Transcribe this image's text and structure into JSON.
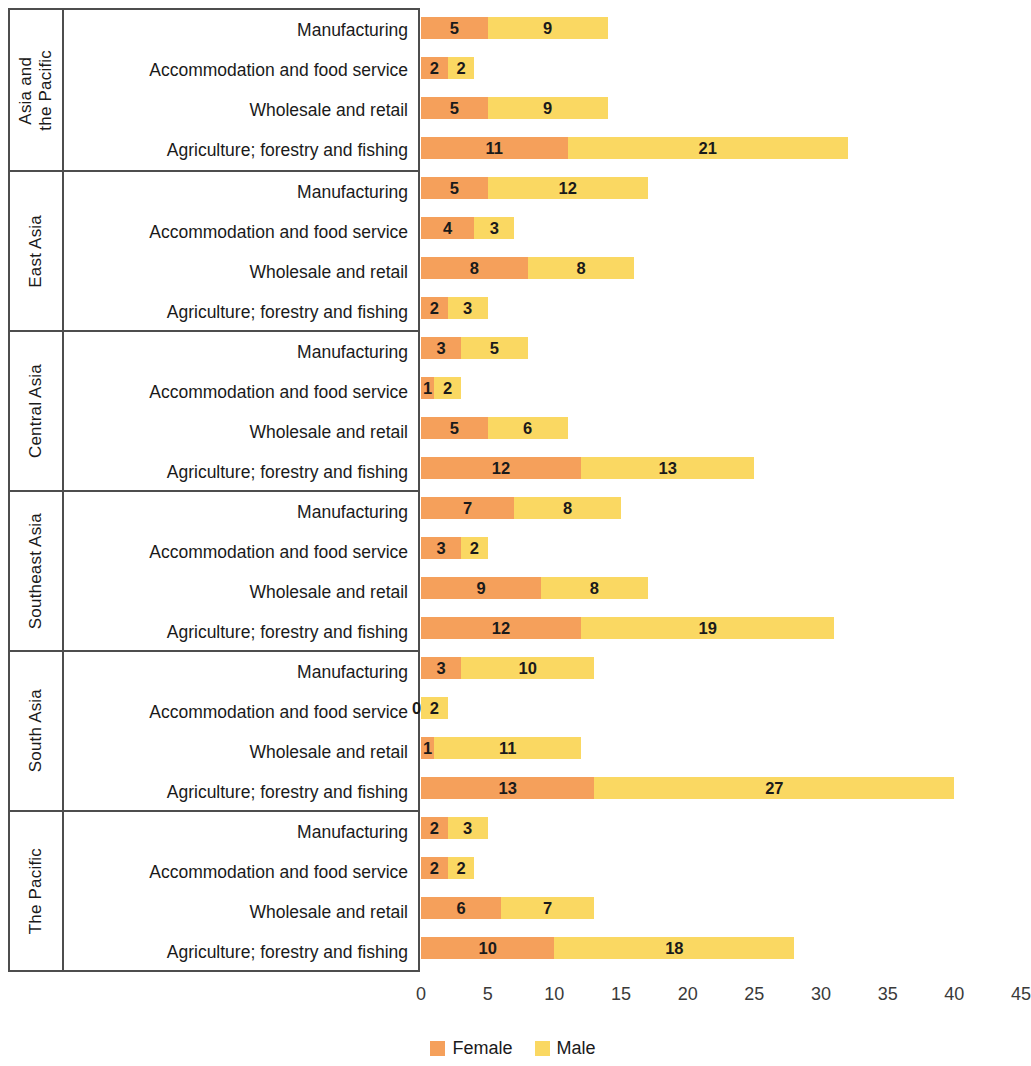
{
  "chart_data": {
    "type": "bar",
    "subtype": "stacked-horizontal-grouped",
    "title": "",
    "xlabel": "",
    "ylabel": "",
    "xlim": [
      0,
      45
    ],
    "xticks": [
      "0",
      "5",
      "10",
      "15",
      "20",
      "25",
      "30",
      "35",
      "40",
      "45"
    ],
    "grid": false,
    "legend_position": "bottom-center",
    "legend": [
      {
        "name": "Female",
        "color": "#f5a05b"
      },
      {
        "name": "Male",
        "color": "#fad862"
      }
    ],
    "series": [
      {
        "name": "Female",
        "color": "#f5a05b"
      },
      {
        "name": "Male",
        "color": "#fad862"
      }
    ],
    "sectors": [
      "Manufacturing",
      "Accommodation and food service",
      "Wholesale and retail",
      "Agriculture; forestry and fishing"
    ],
    "groups": [
      {
        "region": "Asia and\nthe Pacific",
        "rows": [
          {
            "sector": "Manufacturing",
            "female": 5,
            "male": 9
          },
          {
            "sector": "Accommodation and food service",
            "female": 2,
            "male": 2
          },
          {
            "sector": "Wholesale and retail",
            "female": 5,
            "male": 9
          },
          {
            "sector": "Agriculture; forestry and fishing",
            "female": 11,
            "male": 21
          }
        ]
      },
      {
        "region": "East Asia",
        "rows": [
          {
            "sector": "Manufacturing",
            "female": 5,
            "male": 12
          },
          {
            "sector": "Accommodation and food service",
            "female": 4,
            "male": 3
          },
          {
            "sector": "Wholesale and retail",
            "female": 8,
            "male": 8
          },
          {
            "sector": "Agriculture; forestry and fishing",
            "female": 2,
            "male": 3
          }
        ]
      },
      {
        "region": "Central Asia",
        "rows": [
          {
            "sector": "Manufacturing",
            "female": 3,
            "male": 5
          },
          {
            "sector": "Accommodation and food service",
            "female": 1,
            "male": 2
          },
          {
            "sector": "Wholesale and retail",
            "female": 5,
            "male": 6
          },
          {
            "sector": "Agriculture; forestry and fishing",
            "female": 12,
            "male": 13
          }
        ]
      },
      {
        "region": "Southeast Asia",
        "rows": [
          {
            "sector": "Manufacturing",
            "female": 7,
            "male": 8
          },
          {
            "sector": "Accommodation and food service",
            "female": 3,
            "male": 2
          },
          {
            "sector": "Wholesale and retail",
            "female": 9,
            "male": 8
          },
          {
            "sector": "Agriculture; forestry and fishing",
            "female": 12,
            "male": 19
          }
        ]
      },
      {
        "region": "South Asia",
        "rows": [
          {
            "sector": "Manufacturing",
            "female": 3,
            "male": 10
          },
          {
            "sector": "Accommodation and food service",
            "female": 0,
            "male": 2
          },
          {
            "sector": "Wholesale and retail",
            "female": 1,
            "male": 11
          },
          {
            "sector": "Agriculture; forestry and fishing",
            "female": 13,
            "male": 27
          }
        ]
      },
      {
        "region": "The Pacific",
        "rows": [
          {
            "sector": "Manufacturing",
            "female": 2,
            "male": 3
          },
          {
            "sector": "Accommodation and food service",
            "female": 2,
            "male": 2
          },
          {
            "sector": "Wholesale and retail",
            "female": 6,
            "male": 7
          },
          {
            "sector": "Agriculture; forestry and fishing",
            "female": 10,
            "male": 18
          }
        ]
      }
    ]
  }
}
